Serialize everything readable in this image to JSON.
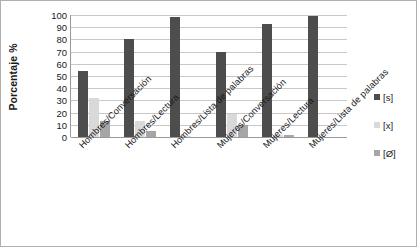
{
  "chart_data": {
    "type": "bar",
    "title": "",
    "subtitle": "",
    "xlabel": "",
    "ylabel": "Porcentaje %",
    "ylim": [
      0,
      100
    ],
    "ytick_step": 10,
    "yticks": [
      100,
      90,
      80,
      70,
      60,
      50,
      40,
      30,
      20,
      10,
      0
    ],
    "grid": true,
    "legend_position": "right",
    "categories": [
      "Hombres/Conversación",
      "Hombres/Lectura",
      "Hombres/Lista de palabras",
      "Mujeres/Conversación",
      "Mujeres/Lectura",
      "Mujeres/Lista de palabras"
    ],
    "series": [
      {
        "name": "[s]",
        "color": "#4d4d4d",
        "values": [
          54,
          80,
          98,
          70,
          93,
          99
        ]
      },
      {
        "name": "[x]",
        "color": "#d9d9d9",
        "values": [
          32,
          13,
          1,
          19,
          2,
          0
        ]
      },
      {
        "name": "[Ø]",
        "color": "#a6a6a6",
        "values": [
          13,
          5,
          0,
          10,
          2,
          0
        ]
      }
    ]
  },
  "legend": {
    "items": [
      {
        "label": "[s]",
        "color": "#4d4d4d"
      },
      {
        "label": "[x]",
        "color": "#d9d9d9"
      },
      {
        "label": "[Ø]",
        "color": "#a6a6a6"
      }
    ]
  }
}
